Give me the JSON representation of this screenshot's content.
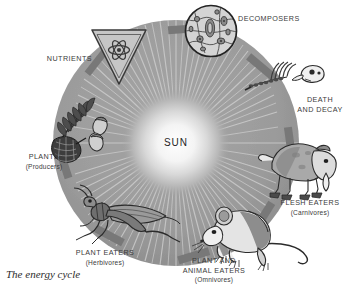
{
  "figure": {
    "caption": "The energy cycle",
    "center_label": "SUN",
    "type": "cycle-diagram",
    "background_color": "#ffffff",
    "ring_color": "#9a9a9a",
    "arrow_color": "#7a7a7a",
    "text_color": "#3b3b3b"
  },
  "stages": [
    {
      "id": "nutrients",
      "label": "NUTRIENTS",
      "sub": "",
      "icon": "inverted-triangle-atom-symbol"
    },
    {
      "id": "decomposers",
      "label": "DECOMPOSERS",
      "sub": "",
      "icon": "microscope-view-microbes"
    },
    {
      "id": "death-and-decay",
      "label": "DEATH",
      "sub": "AND DECAY",
      "icon": "animal-skeleton-bones"
    },
    {
      "id": "flesh-eaters",
      "label": "FLESH EATERS",
      "sub": "(Carnivores)",
      "icon": "opossum-carnivore"
    },
    {
      "id": "plant-and-animal-eaters",
      "label": "PLANT AND",
      "label2": "ANIMAL EATERS",
      "sub": "(Omnivores)",
      "icon": "mouse-omnivore"
    },
    {
      "id": "plant-eaters",
      "label": "PLANT EATERS",
      "sub": "(Herbivores)",
      "icon": "grasshopper-herbivore"
    },
    {
      "id": "plants",
      "label": "PLANTS",
      "sub": "(Producers)",
      "icon": "pinecone-fern-nuts"
    }
  ]
}
